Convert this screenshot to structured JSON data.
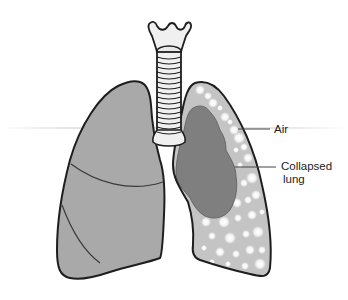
{
  "diagram": {
    "labels": {
      "air": "Air",
      "collapsed_line1": "Collapsed",
      "collapsed_line2": "lung"
    },
    "colors": {
      "healthy_lung": "#a9a9a9",
      "collapsed_lung": "#7f7f7f",
      "air_space": "#c4c4c4",
      "air_bubbles": "#f2f2f2",
      "outline": "#1e1e1e",
      "trachea_fill": "#f0f0f0"
    },
    "structures": [
      "trachea",
      "larynx",
      "bronchi",
      "right-lung",
      "left-lung-air-space",
      "collapsed-lung"
    ]
  }
}
